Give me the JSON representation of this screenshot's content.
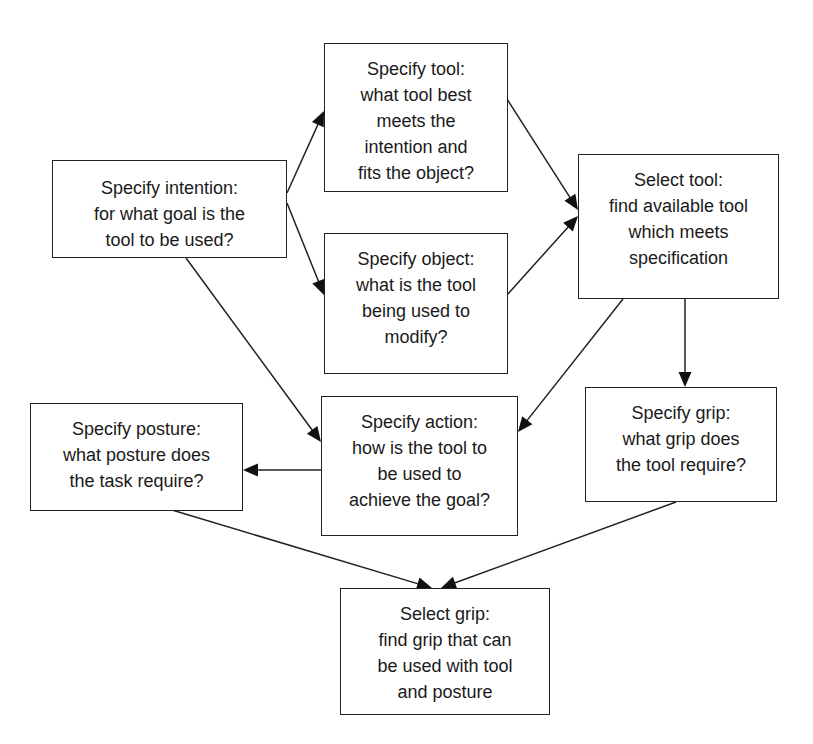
{
  "diagram": {
    "type": "flowchart",
    "nodes": [
      {
        "id": "specify_intention",
        "title": "Specify intention:",
        "lines": [
          "for what goal is the",
          "tool to be used?"
        ]
      },
      {
        "id": "specify_tool",
        "title": "Specify tool:",
        "lines": [
          "what tool best",
          "meets the",
          "intention and",
          "fits the object?"
        ]
      },
      {
        "id": "specify_object",
        "title": "Specify object:",
        "lines": [
          "what is the tool",
          "being used to",
          "modify?"
        ]
      },
      {
        "id": "select_tool",
        "title": "Select tool:",
        "lines": [
          "find available tool",
          "which meets",
          "specification"
        ]
      },
      {
        "id": "specify_posture",
        "title": "Specify posture:",
        "lines": [
          "what posture does",
          "the task require?"
        ]
      },
      {
        "id": "specify_action",
        "title": "Specify action:",
        "lines": [
          "how is the tool to",
          "be used to",
          "achieve the goal?"
        ]
      },
      {
        "id": "specify_grip",
        "title": "Specify grip:",
        "lines": [
          "what grip does",
          "the tool require?"
        ]
      },
      {
        "id": "select_grip",
        "title": "Select grip:",
        "lines": [
          "find grip that can",
          "be used with tool",
          "and posture"
        ]
      }
    ],
    "edges": [
      {
        "from": "specify_intention",
        "to": "specify_tool"
      },
      {
        "from": "specify_intention",
        "to": "specify_object"
      },
      {
        "from": "specify_intention",
        "to": "specify_action"
      },
      {
        "from": "specify_tool",
        "to": "select_tool"
      },
      {
        "from": "specify_object",
        "to": "select_tool"
      },
      {
        "from": "select_tool",
        "to": "specify_action"
      },
      {
        "from": "select_tool",
        "to": "specify_grip"
      },
      {
        "from": "specify_action",
        "to": "specify_posture"
      },
      {
        "from": "specify_posture",
        "to": "select_grip"
      },
      {
        "from": "specify_grip",
        "to": "select_grip"
      }
    ]
  }
}
